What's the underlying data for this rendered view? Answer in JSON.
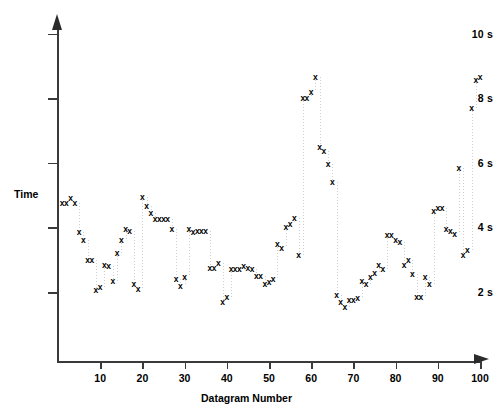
{
  "chart_data": {
    "type": "scatter",
    "title": "",
    "xlabel": "Datagram Number",
    "ylabel": "Time",
    "xlim": [
      0,
      103
    ],
    "ylim": [
      0,
      10.6
    ],
    "xticks": [
      10,
      20,
      30,
      40,
      50,
      60,
      70,
      80,
      90,
      100
    ],
    "xtick_labels": [
      "10",
      "20",
      "30",
      "40",
      "50",
      "60",
      "70",
      "80",
      "90",
      "100"
    ],
    "yticks": [
      2,
      4,
      6,
      8,
      10
    ],
    "ytick_labels": [
      "2 s",
      "4 s",
      "6 s",
      "8 s",
      "10 s"
    ],
    "grid": false,
    "legend": null,
    "marker": "x",
    "marker_color": "#000000",
    "dropline_color": "#cfcfcf",
    "x": [
      1,
      2,
      3,
      4,
      5,
      6,
      7,
      8,
      9,
      10,
      11,
      12,
      13,
      14,
      15,
      16,
      17,
      18,
      19,
      20,
      21,
      22,
      23,
      24,
      25,
      26,
      27,
      28,
      29,
      30,
      31,
      32,
      33,
      34,
      35,
      36,
      37,
      38,
      39,
      40,
      41,
      42,
      43,
      44,
      45,
      46,
      47,
      48,
      49,
      50,
      51,
      52,
      53,
      54,
      55,
      56,
      57,
      58,
      59,
      60,
      61,
      62,
      63,
      64,
      65,
      66,
      67,
      68,
      69,
      70,
      71,
      72,
      73,
      74,
      75,
      76,
      77,
      78,
      79,
      80,
      81,
      82,
      83,
      84,
      85,
      86,
      87,
      88,
      89,
      90,
      91,
      92,
      93,
      94,
      95,
      96,
      97,
      98,
      99,
      100
    ],
    "y": [
      4.75,
      4.75,
      4.9,
      4.75,
      3.85,
      3.6,
      3.0,
      3.0,
      2.05,
      2.15,
      2.85,
      2.8,
      2.35,
      3.2,
      3.6,
      3.95,
      3.9,
      2.25,
      2.1,
      4.95,
      4.65,
      4.45,
      4.25,
      4.25,
      4.25,
      4.25,
      3.95,
      2.4,
      2.2,
      2.45,
      3.95,
      3.85,
      3.9,
      3.9,
      3.9,
      2.75,
      2.75,
      2.9,
      1.7,
      1.85,
      2.7,
      2.7,
      2.7,
      2.8,
      2.75,
      2.7,
      2.5,
      2.5,
      2.25,
      2.3,
      2.4,
      3.5,
      3.35,
      4.0,
      4.1,
      4.3,
      3.15,
      8.0,
      8.0,
      8.2,
      8.65,
      6.5,
      6.35,
      5.95,
      5.4,
      1.9,
      1.7,
      1.55,
      1.75,
      1.75,
      1.8,
      2.35,
      2.25,
      2.45,
      2.6,
      2.85,
      2.7,
      3.75,
      3.75,
      3.6,
      3.55,
      2.85,
      3.0,
      2.55,
      1.85,
      1.85,
      2.45,
      2.25,
      4.5,
      4.6,
      4.6,
      3.95,
      3.9,
      3.8,
      5.85,
      3.15,
      3.3,
      7.7,
      8.55,
      8.65
    ]
  }
}
